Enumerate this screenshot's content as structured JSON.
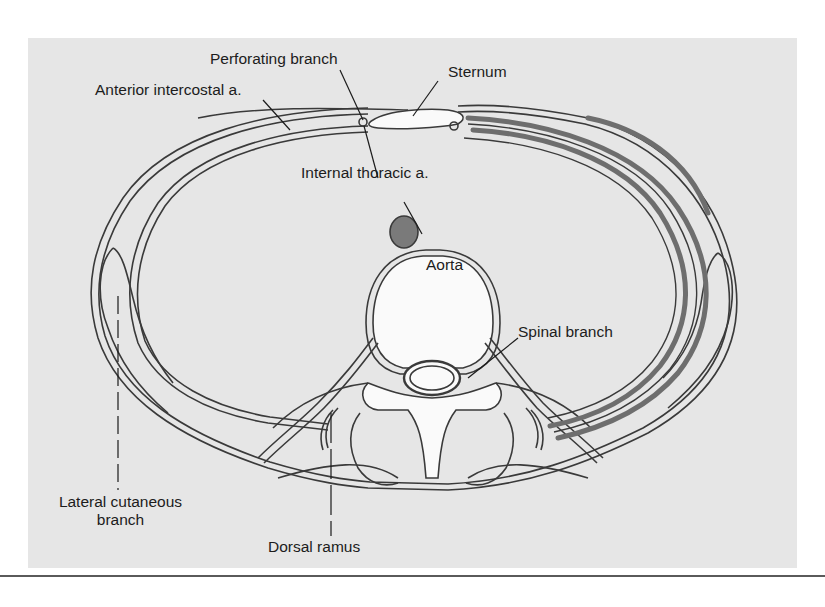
{
  "figure": {
    "type": "anatomical-cross-section",
    "background_color": "#e6e6e6",
    "line_color": "#3a3a3a",
    "muscle_band_color": "#6e6e6e",
    "aorta_fill_color": "#7a7a7a",
    "bone_fill_color": "#fafafa",
    "labels": {
      "perforating_branch": "Perforating branch",
      "sternum": "Sternum",
      "anterior_intercostal": "Anterior intercostal a.",
      "internal_thoracic": "Internal thoracic a.",
      "aorta": "Aorta",
      "spinal_branch": "Spinal branch",
      "lateral_cutaneous_line1": "Lateral cutaneous",
      "lateral_cutaneous_line2": "branch",
      "dorsal_ramus": "Dorsal ramus"
    }
  }
}
